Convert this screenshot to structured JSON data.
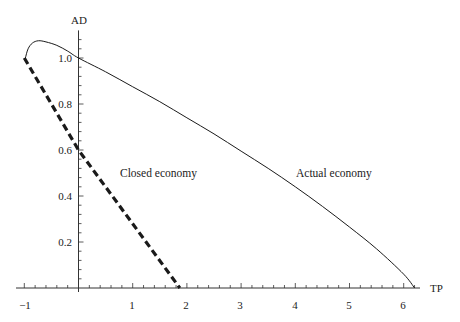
{
  "chart_data": {
    "type": "line",
    "title": "",
    "xlabel": "TP",
    "ylabel": "AD",
    "xlim": [
      -1.1,
      6.5
    ],
    "ylim": [
      0,
      1.12
    ],
    "grid": false,
    "legend": "none (inline annotations)",
    "x_ticks": [
      -1,
      1,
      2,
      3,
      4,
      5,
      6
    ],
    "x_tick_labels": [
      "−1",
      "1",
      "2",
      "3",
      "4",
      "5",
      "6"
    ],
    "x_minor_step": 0.2,
    "y_ticks": [
      0.2,
      0.4,
      0.6,
      0.8,
      1.0
    ],
    "y_tick_labels": [
      "0.2",
      "0.4",
      "0.6",
      "0.8",
      "1.0"
    ],
    "y_minor_step": 0.04,
    "series": [
      {
        "name": "Actual economy",
        "style": "solid thin",
        "points": [
          [
            -0.98,
            1.0
          ],
          [
            -0.93,
            1.04
          ],
          [
            -0.85,
            1.065
          ],
          [
            -0.74,
            1.075
          ],
          [
            -0.6,
            1.07
          ],
          [
            -0.4,
            1.055
          ],
          [
            -0.2,
            1.03
          ],
          [
            0,
            1.0
          ],
          [
            0.5,
            0.94
          ],
          [
            1.0,
            0.875
          ],
          [
            1.5,
            0.81
          ],
          [
            2.0,
            0.74
          ],
          [
            2.5,
            0.67
          ],
          [
            3.0,
            0.595
          ],
          [
            3.5,
            0.52
          ],
          [
            4.0,
            0.44
          ],
          [
            4.5,
            0.355
          ],
          [
            5.0,
            0.265
          ],
          [
            5.5,
            0.17
          ],
          [
            6.0,
            0.06
          ],
          [
            6.2,
            0.0
          ]
        ]
      },
      {
        "name": "Closed economy",
        "style": "dashed thick",
        "points": [
          [
            -1.0,
            1.0
          ],
          [
            0,
            0.6
          ],
          [
            1.87,
            0.0
          ]
        ]
      }
    ],
    "annotations": [
      {
        "text": "Closed economy",
        "x": 0.55,
        "y": 0.43
      },
      {
        "text": "Actual economy",
        "x": 3.3,
        "y": 0.43
      }
    ]
  },
  "labels": {
    "xlabel": "TP",
    "ylabel": "AD",
    "closed": "Closed economy",
    "actual": "Actual economy",
    "xt": [
      "−1",
      "1",
      "2",
      "3",
      "4",
      "5",
      "6"
    ],
    "yt": [
      "0.2",
      "0.4",
      "0.6",
      "0.8",
      "1.0"
    ]
  },
  "colors": {
    "line": "#1a1a1a",
    "axis": "#333333"
  }
}
